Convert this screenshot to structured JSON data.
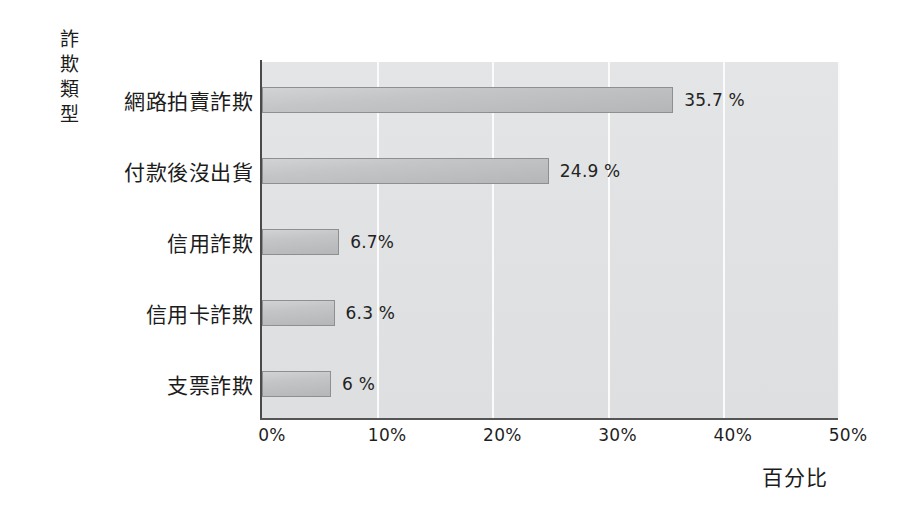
{
  "chart_data": {
    "type": "bar",
    "orientation": "horizontal",
    "title": "",
    "xlabel": "百分比",
    "ylabel": "詐欺類型",
    "categories": [
      "網路拍賣詐欺",
      "付款後沒出貨",
      "信用詐欺",
      "信用卡詐欺",
      "支票詐欺"
    ],
    "values": [
      35.7,
      24.9,
      6.7,
      6.3,
      6
    ],
    "value_labels": [
      "35.7 %",
      "24.9 %",
      "6.7%",
      "6.3 %",
      "6 %"
    ],
    "xlim": [
      0,
      50
    ],
    "xticks": [
      0,
      10,
      20,
      30,
      40,
      50
    ],
    "xtick_labels": [
      "0%",
      "10%",
      "20%",
      "30%",
      "40%",
      "50%"
    ],
    "grid": "vertical",
    "legend": "none",
    "bar_color": "#c3c5c6",
    "bar_border_color": "#8d8f90",
    "plot_background": "#e1e2e3",
    "gridline_color": "#fbfbfb",
    "axis_color": "#4a4a4a",
    "text_color": "#1c1c1c"
  },
  "axis": {
    "y_title_vertical": "詐\n欺\n類\n型",
    "x_title": "百分比"
  }
}
